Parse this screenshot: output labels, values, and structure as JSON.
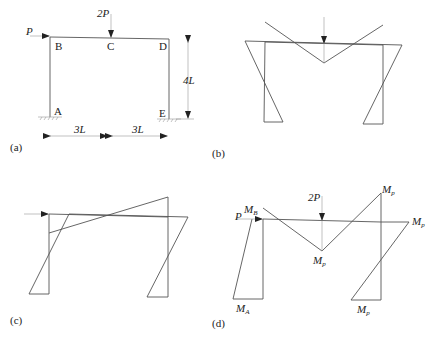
{
  "panels": {
    "a": {
      "label": "(a)",
      "loads": {
        "horizontal": "P",
        "vertical": "2P"
      },
      "nodes": {
        "A": "A",
        "B": "B",
        "C": "C",
        "D": "D",
        "E": "E"
      },
      "dims": {
        "span_left": "3L",
        "span_right": "3L",
        "height": "4L"
      }
    },
    "b": {
      "label": "(b)"
    },
    "c": {
      "label": "(c)"
    },
    "d": {
      "label": "(d)",
      "loads": {
        "horizontal": "P",
        "vertical": "2P"
      },
      "moments": {
        "MB": {
          "main": "M",
          "sub": "B"
        },
        "MA": {
          "main": "M",
          "sub": "A"
        },
        "Mp_mid": {
          "main": "M",
          "sub": "p"
        },
        "Mp_top": {
          "main": "M",
          "sub": "p"
        },
        "Mp_right": {
          "main": "M",
          "sub": "p"
        },
        "Mp_bottom": {
          "main": "M",
          "sub": "p"
        }
      }
    }
  }
}
